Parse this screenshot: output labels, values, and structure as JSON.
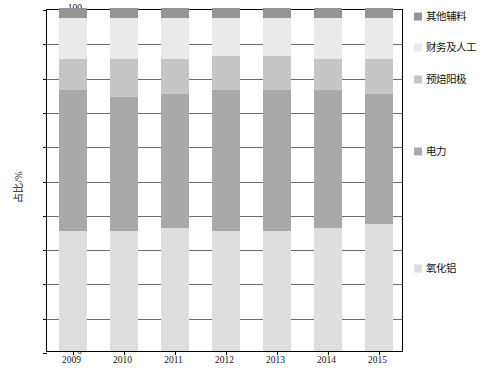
{
  "chart_data": {
    "type": "bar",
    "subtype": "stacked-bar-100",
    "title": "",
    "xlabel": "",
    "ylabel": "占比/%",
    "ylim": [
      0,
      100
    ],
    "ytick_step": 10,
    "yticks": [
      "0",
      "10",
      "20",
      "30",
      "40",
      "50",
      "60",
      "70",
      "80",
      "90",
      "100"
    ],
    "grid": true,
    "legend_position": "right",
    "categories": [
      "2009",
      "2010",
      "2011",
      "2012",
      "2013",
      "2014",
      "2015"
    ],
    "series": [
      {
        "name": "氧化铝",
        "color": "#dedede",
        "values": [
          35,
          35,
          36,
          35,
          35,
          36,
          37
        ]
      },
      {
        "name": "电力",
        "color": "#a9a9a9",
        "values": [
          41,
          39,
          39,
          41,
          41,
          40,
          38
        ]
      },
      {
        "name": "预焙阳极",
        "color": "#c6c6c6",
        "values": [
          9,
          11,
          10,
          10,
          10,
          9,
          10
        ]
      },
      {
        "name": "财务及人工",
        "color": "#eaeaea",
        "values": [
          12,
          12,
          12,
          11,
          11,
          12,
          12
        ]
      },
      {
        "name": "其他辅料",
        "color": "#949494",
        "values": [
          3,
          3,
          3,
          3,
          3,
          3,
          3
        ]
      }
    ],
    "legend_entries": [
      {
        "label": "其他辅料",
        "color": "#949494",
        "y": 16
      },
      {
        "label": "财务及人工",
        "color": "#eaeaea",
        "y": 47
      },
      {
        "label": "预焙阳极",
        "color": "#c6c6c6",
        "y": 79
      },
      {
        "label": "电力",
        "color": "#a9a9a9",
        "y": 151
      },
      {
        "label": "氧化铝",
        "color": "#dedede",
        "y": 268
      }
    ]
  }
}
